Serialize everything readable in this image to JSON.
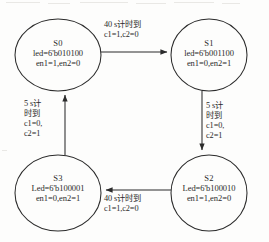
{
  "diagram": {
    "type": "state-transition-diagram",
    "background_color": "#fdfdfc",
    "stroke_color": "#2b2b2b",
    "states": [
      {
        "id": "s0",
        "name": "S0",
        "led": "led=6'b010100",
        "enables": "en1=1,en2=0",
        "cx": 58,
        "cy": 55,
        "rx": 43,
        "ry": 36
      },
      {
        "id": "s1",
        "name": "S1",
        "led": "led=6'b001100",
        "enables": "en1=0,en2=1",
        "cx": 209,
        "cy": 55,
        "rx": 38,
        "ry": 36
      },
      {
        "id": "s2",
        "name": "S2",
        "led": "Led=6'b100010",
        "enables": "en1=1,en2=0",
        "cx": 209,
        "cy": 193,
        "rx": 38,
        "ry": 38
      },
      {
        "id": "s3",
        "name": "S3",
        "led": "Led=6'b100001",
        "enables": "en1=0,en2=1",
        "cx": 58,
        "cy": 193,
        "rx": 43,
        "ry": 38
      }
    ],
    "transitions": [
      {
        "id": "s0-s1",
        "from": "S0",
        "to": "S1",
        "direction": "right",
        "lines": [
          "40 s计时到",
          "c1=1,c2=0"
        ]
      },
      {
        "id": "s1-s2",
        "from": "S1",
        "to": "S2",
        "direction": "down",
        "lines": [
          "5 s计",
          "时到",
          "c1=0,",
          "c2=1"
        ]
      },
      {
        "id": "s2-s3",
        "from": "S2",
        "to": "S3",
        "direction": "left",
        "lines": [
          "40 s计时到",
          "c1=1,c2=0"
        ]
      },
      {
        "id": "s3-s0",
        "from": "S3",
        "to": "S0",
        "direction": "up",
        "lines": [
          "5 s计",
          "时到",
          "c1=0,",
          "c2=1"
        ]
      }
    ]
  }
}
